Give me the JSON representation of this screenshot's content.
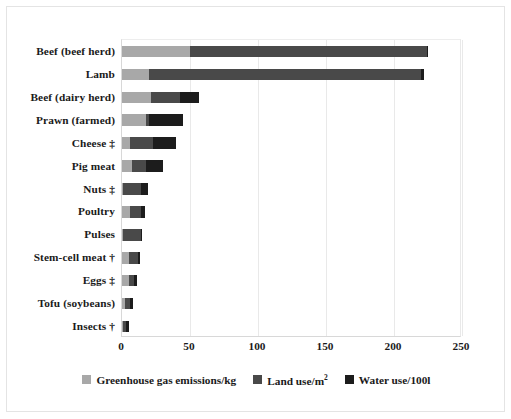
{
  "chart_data": {
    "type": "bar",
    "orientation": "horizontal",
    "stacked": true,
    "title": "",
    "xlabel": "",
    "ylabel": "",
    "xlim": [
      0,
      250
    ],
    "xticks": [
      0,
      50,
      100,
      150,
      200,
      250
    ],
    "xtick_labels": [
      "0",
      "50",
      "100",
      "150",
      "200",
      "250"
    ],
    "grid": true,
    "legend_position": "bottom",
    "legend": [
      {
        "name": "Greenhouse gas emissions/kg",
        "unit_html": "Greenhouse gas emissions/kg",
        "color": "#a8a8a8",
        "swatch": "ghg"
      },
      {
        "name": "Land use/m2",
        "unit_html": "Land use/m<sup>2</sup>",
        "color": "#494949",
        "swatch": "land"
      },
      {
        "name": "Water use/100l",
        "unit_html": "Water use/100l",
        "color": "#1c1c1c",
        "swatch": "water"
      }
    ],
    "categories": [
      "Beef (beef herd)",
      "Lamb",
      "Beef (dairy herd)",
      "Prawn (farmed)",
      "Cheese ‡",
      "Pig meat",
      "Nuts ‡",
      "Poultry",
      "Pulses",
      "Stem-cell meat †",
      "Eggs ‡",
      "Tofu (soybeans)",
      "Insects †"
    ],
    "series": [
      {
        "name": "Greenhouse gas emissions/kg",
        "values": [
          50,
          20,
          21,
          18,
          6,
          7,
          1,
          6,
          1,
          5,
          5,
          2,
          1
        ]
      },
      {
        "name": "Land use/m2",
        "values": [
          174,
          200,
          22,
          2,
          17,
          11,
          13,
          8,
          13,
          7,
          4,
          4,
          2
        ]
      },
      {
        "name": "Water use/100l",
        "values": [
          1,
          2,
          14,
          25,
          17,
          12,
          5,
          3,
          1,
          1,
          2,
          2,
          2
        ]
      }
    ],
    "totals": [
      225,
      222,
      57,
      45,
      40,
      30,
      19,
      17,
      15,
      13,
      11,
      8,
      5
    ]
  }
}
